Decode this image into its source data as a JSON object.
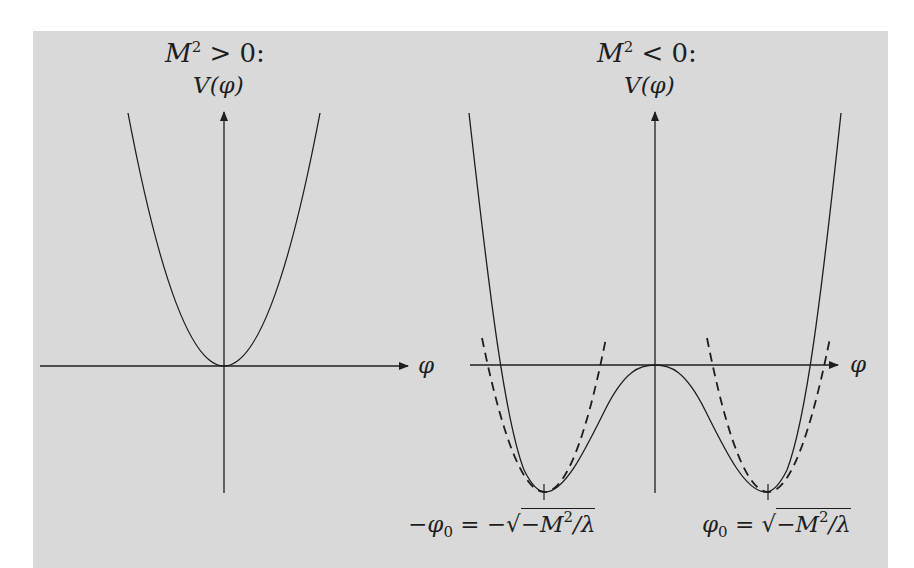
{
  "figure": {
    "background_color": "#d9d9d9",
    "line_color": "#1e1e1e",
    "left_panel": {
      "title": "M² > 0:",
      "title_parts": {
        "var": "M",
        "sup": "2",
        "rel": " > 0:"
      },
      "y_axis_label": "V(φ)",
      "y_axis_label_parts": {
        "var": "V",
        "arg": "(φ)"
      },
      "x_axis_label": "φ",
      "curve": "parabola, minimum at origin"
    },
    "right_panel": {
      "title": "M² < 0:",
      "title_parts": {
        "var": "M",
        "sup": "2",
        "rel": " < 0:"
      },
      "y_axis_label": "V(φ)",
      "y_axis_label_parts": {
        "var": "V",
        "arg": "(φ)"
      },
      "x_axis_label": "φ",
      "curve": "double-well potential with dashed parabolic approximations at minima",
      "left_min_label": "−φ₀ = −√(−M²/λ)",
      "left_min_label_parts": {
        "pre": "−",
        "phi": "φ",
        "sub": "0",
        "eq": " = −",
        "radical": "√",
        "rad_pre": "−",
        "rad_var": "M",
        "rad_sup": "2",
        "rad_post": "/λ"
      },
      "right_min_label": "φ₀ = √(−M²/λ)",
      "right_min_label_parts": {
        "phi": "φ",
        "sub": "0",
        "eq": " = ",
        "radical": "√",
        "rad_pre": "−",
        "rad_var": "M",
        "rad_sup": "2",
        "rad_post": "/λ"
      }
    }
  }
}
